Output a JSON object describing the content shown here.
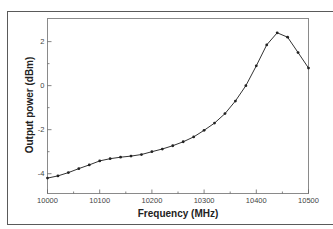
{
  "chart_data": {
    "type": "line",
    "title": "",
    "xlabel": "Frequency (MHz)",
    "ylabel": "Output power (dBm)",
    "xlim": [
      10000,
      10500
    ],
    "ylim": [
      -4.9,
      3.05
    ],
    "x_ticks": [
      10000,
      10100,
      10200,
      10300,
      10400,
      10500
    ],
    "x_tick_labels": [
      "10000",
      "10100",
      "10200",
      "10300",
      "10400",
      "10500"
    ],
    "x_minor_ticks": [
      10050,
      10150,
      10250,
      10350,
      10450
    ],
    "y_ticks": [
      2,
      0,
      -2,
      -4
    ],
    "y_tick_labels": [
      "2",
      "0",
      "-2",
      "-4"
    ],
    "y_minor_ticks": [
      1,
      -1,
      -3
    ],
    "grid": false,
    "legend": null,
    "markers": true,
    "series": [
      {
        "name": "Output power",
        "color": "#333333",
        "x": [
          10000,
          10020,
          10040,
          10060,
          10080,
          10100,
          10120,
          10140,
          10160,
          10180,
          10200,
          10220,
          10240,
          10260,
          10280,
          10300,
          10320,
          10340,
          10360,
          10380,
          10400,
          10420,
          10440,
          10460,
          10480,
          10500
        ],
        "y": [
          -4.2,
          -4.1,
          -3.95,
          -3.77,
          -3.6,
          -3.42,
          -3.32,
          -3.25,
          -3.2,
          -3.13,
          -3.0,
          -2.88,
          -2.73,
          -2.55,
          -2.33,
          -2.03,
          -1.7,
          -1.27,
          -0.7,
          0.0,
          0.9,
          1.85,
          2.4,
          2.2,
          1.5,
          0.8
        ]
      }
    ]
  }
}
